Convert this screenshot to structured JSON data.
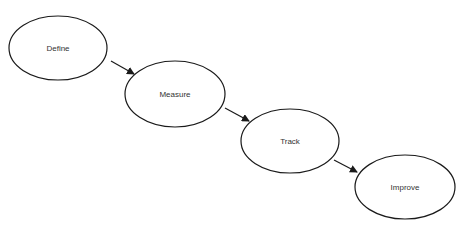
{
  "diagram": {
    "type": "flow",
    "nodes": [
      {
        "id": "define",
        "label": "Define",
        "cx": 58,
        "cy": 48,
        "rx": 49,
        "ry": 32
      },
      {
        "id": "measure",
        "label": "Measure",
        "cx": 175,
        "cy": 94,
        "rx": 50,
        "ry": 33
      },
      {
        "id": "track",
        "label": "Track",
        "cx": 290,
        "cy": 141,
        "rx": 49,
        "ry": 32
      },
      {
        "id": "improve",
        "label": "Improve",
        "cx": 405,
        "cy": 187,
        "rx": 50,
        "ry": 32
      }
    ],
    "edges": [
      {
        "from": "define",
        "to": "measure"
      },
      {
        "from": "measure",
        "to": "track"
      },
      {
        "from": "track",
        "to": "improve"
      }
    ],
    "colors": {
      "stroke": "#1a1a1a",
      "fill": "#ffffff",
      "text": "#333333"
    }
  }
}
